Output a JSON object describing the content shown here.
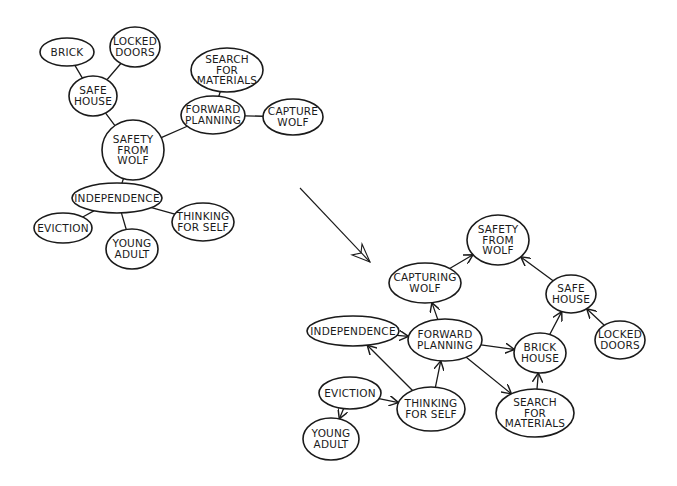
{
  "colors": {
    "ink": "#1a1a1a",
    "background": "#ffffff"
  },
  "before_map": {
    "title": "Mind map (undirected)",
    "nodes": [
      {
        "id": "brick_l",
        "label": [
          "BRICK"
        ],
        "cx": 67,
        "cy": 52,
        "rx": 27,
        "ry": 14
      },
      {
        "id": "locked_l",
        "label": [
          "LOCKED",
          "DOORS"
        ],
        "cx": 135,
        "cy": 47,
        "rx": 25,
        "ry": 20
      },
      {
        "id": "safehouse_l",
        "label": [
          "SAFE",
          "HOUSE"
        ],
        "cx": 93,
        "cy": 96,
        "rx": 24,
        "ry": 20
      },
      {
        "id": "search_l",
        "label": [
          "SEARCH",
          "FOR",
          "MATERIALS"
        ],
        "cx": 227,
        "cy": 70,
        "rx": 36,
        "ry": 22
      },
      {
        "id": "forward_l",
        "label": [
          "FORWARD",
          "PLANNING"
        ],
        "cx": 213,
        "cy": 115,
        "rx": 32,
        "ry": 19
      },
      {
        "id": "capture_l",
        "label": [
          "CAPTURE",
          "WOLF"
        ],
        "cx": 293,
        "cy": 117,
        "rx": 30,
        "ry": 18
      },
      {
        "id": "safety_l",
        "label": [
          "SAFETY",
          "FROM",
          "WOLF"
        ],
        "cx": 133,
        "cy": 150,
        "rx": 31,
        "ry": 30
      },
      {
        "id": "independence_l",
        "label": [
          "INDEPENDENCE"
        ],
        "cx": 117,
        "cy": 198,
        "rx": 45,
        "ry": 15
      },
      {
        "id": "eviction_l",
        "label": [
          "EVICTION"
        ],
        "cx": 63,
        "cy": 228,
        "rx": 29,
        "ry": 15
      },
      {
        "id": "young_l",
        "label": [
          "YOUNG",
          "ADULT"
        ],
        "cx": 132,
        "cy": 249,
        "rx": 26,
        "ry": 20
      },
      {
        "id": "thinking_l",
        "label": [
          "THINKING",
          "FOR SELF"
        ],
        "cx": 203,
        "cy": 222,
        "rx": 31,
        "ry": 19
      }
    ],
    "edges": [
      {
        "from": "brick_l",
        "to": "safehouse_l"
      },
      {
        "from": "locked_l",
        "to": "safehouse_l"
      },
      {
        "from": "safehouse_l",
        "to": "safety_l"
      },
      {
        "from": "search_l",
        "to": "forward_l"
      },
      {
        "from": "forward_l",
        "to": "capture_l"
      },
      {
        "from": "forward_l",
        "to": "safety_l"
      },
      {
        "from": "safety_l",
        "to": "independence_l"
      },
      {
        "from": "independence_l",
        "to": "eviction_l"
      },
      {
        "from": "independence_l",
        "to": "young_l"
      },
      {
        "from": "independence_l",
        "to": "thinking_l"
      }
    ]
  },
  "transform_arrow": {
    "x1": 300,
    "y1": 188,
    "x2": 370,
    "y2": 262,
    "direction": "down-right"
  },
  "after_map": {
    "title": "Causal map (directed)",
    "nodes": [
      {
        "id": "safety_r",
        "label": [
          "SAFETY",
          "FROM",
          "WOLF"
        ],
        "cx": 498,
        "cy": 240,
        "rx": 31,
        "ry": 25
      },
      {
        "id": "capturing_r",
        "label": [
          "CAPTURING",
          "WOLF"
        ],
        "cx": 425,
        "cy": 283,
        "rx": 36,
        "ry": 20
      },
      {
        "id": "safehouse_r",
        "label": [
          "SAFE",
          "HOUSE"
        ],
        "cx": 571,
        "cy": 294,
        "rx": 25,
        "ry": 19
      },
      {
        "id": "independence_r",
        "label": [
          "INDEPENDENCE"
        ],
        "cx": 353,
        "cy": 331,
        "rx": 46,
        "ry": 15
      },
      {
        "id": "forward_r",
        "label": [
          "FORWARD",
          "PLANNING"
        ],
        "cx": 445,
        "cy": 340,
        "rx": 37,
        "ry": 21
      },
      {
        "id": "brick_r",
        "label": [
          "BRICK",
          "HOUSE"
        ],
        "cx": 540,
        "cy": 353,
        "rx": 26,
        "ry": 20
      },
      {
        "id": "locked_r",
        "label": [
          "LOCKED",
          "DOORS"
        ],
        "cx": 620,
        "cy": 340,
        "rx": 25,
        "ry": 19
      },
      {
        "id": "eviction_r",
        "label": [
          "EVICTION"
        ],
        "cx": 350,
        "cy": 393,
        "rx": 31,
        "ry": 16
      },
      {
        "id": "thinking_r",
        "label": [
          "THINKING",
          "FOR SELF"
        ],
        "cx": 431,
        "cy": 409,
        "rx": 34,
        "ry": 22
      },
      {
        "id": "search_r",
        "label": [
          "SEARCH",
          "FOR",
          "MATERIALS"
        ],
        "cx": 535,
        "cy": 413,
        "rx": 39,
        "ry": 24
      },
      {
        "id": "young_r",
        "label": [
          "YOUNG",
          "ADULT"
        ],
        "cx": 331,
        "cy": 439,
        "rx": 28,
        "ry": 21
      }
    ],
    "edges": [
      {
        "from": "capturing_r",
        "to": "safety_r"
      },
      {
        "from": "safehouse_r",
        "to": "safety_r"
      },
      {
        "from": "forward_r",
        "to": "capturing_r"
      },
      {
        "from": "independence_r",
        "to": "forward_r"
      },
      {
        "from": "forward_r",
        "to": "brick_r"
      },
      {
        "from": "forward_r",
        "to": "search_r"
      },
      {
        "from": "brick_r",
        "to": "safehouse_r"
      },
      {
        "from": "locked_r",
        "to": "safehouse_r"
      },
      {
        "from": "search_r",
        "to": "brick_r"
      },
      {
        "from": "thinking_r",
        "to": "independence_r"
      },
      {
        "from": "thinking_r",
        "to": "forward_r"
      },
      {
        "from": "eviction_r",
        "to": "thinking_r"
      },
      {
        "from": "eviction_r",
        "to": "young_r"
      }
    ]
  }
}
